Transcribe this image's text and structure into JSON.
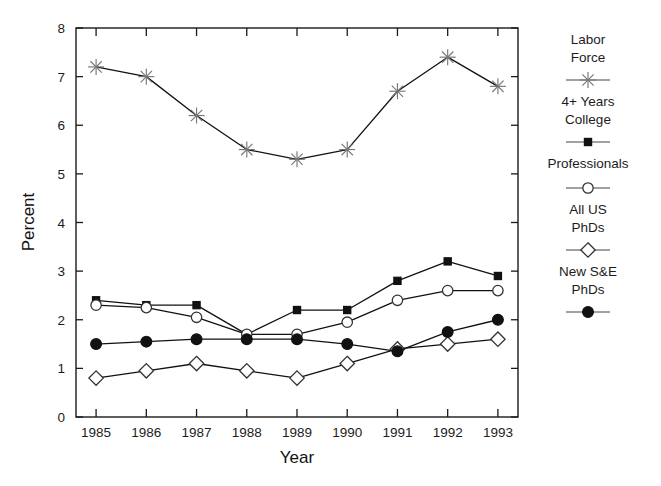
{
  "chart_data": {
    "type": "line",
    "title": "",
    "xlabel": "Year",
    "ylabel": "Percent",
    "categories": [
      "1985",
      "1986",
      "1987",
      "1988",
      "1989",
      "1990",
      "1991",
      "1992",
      "1993"
    ],
    "x": [
      1985,
      1986,
      1987,
      1988,
      1989,
      1990,
      1991,
      1992,
      1993
    ],
    "xlim": [
      1984.6,
      1993.4
    ],
    "ylim": [
      0,
      8
    ],
    "yticks": [
      0,
      1,
      2,
      3,
      4,
      5,
      6,
      7,
      8
    ],
    "xticks": [
      1985,
      1986,
      1987,
      1988,
      1989,
      1990,
      1991,
      1992,
      1993
    ],
    "grid": false,
    "legend_position": "right",
    "series": [
      {
        "name": "Labor Force",
        "marker": "asterisk",
        "values": [
          7.2,
          7.0,
          6.2,
          5.5,
          5.3,
          5.5,
          6.7,
          7.4,
          6.8
        ]
      },
      {
        "name": "4+ Years College",
        "marker": "filled-square",
        "values": [
          2.4,
          2.3,
          2.3,
          1.7,
          2.2,
          2.2,
          2.8,
          3.2,
          2.9
        ]
      },
      {
        "name": "Professionals",
        "marker": "open-circle",
        "values": [
          2.3,
          2.25,
          2.05,
          1.7,
          1.7,
          1.95,
          2.4,
          2.6,
          2.6
        ]
      },
      {
        "name": "All US PhDs",
        "marker": "open-diamond",
        "values": [
          0.8,
          0.95,
          1.1,
          0.95,
          0.8,
          1.1,
          1.4,
          1.5,
          1.6
        ]
      },
      {
        "name": "New S&E PhDs",
        "marker": "filled-circle",
        "values": [
          1.5,
          1.55,
          1.6,
          1.6,
          1.6,
          1.5,
          1.35,
          1.75,
          2.0
        ]
      }
    ]
  },
  "axes": {
    "y_title": "Percent",
    "x_title": "Year",
    "y_tick_labels": [
      "8",
      "7",
      "6",
      "5",
      "4",
      "3",
      "2",
      "1",
      "0"
    ],
    "x_tick_labels": [
      "1985",
      "1986",
      "1987",
      "1988",
      "1989",
      "1990",
      "1991",
      "1992",
      "1993"
    ]
  },
  "legend": {
    "entries": [
      {
        "line1": "Labor",
        "line2": "Force",
        "marker": "asterisk"
      },
      {
        "line1": "4+ Years",
        "line2": "College",
        "marker": "filled-square"
      },
      {
        "line1": "Professionals",
        "line2": "",
        "marker": "open-circle"
      },
      {
        "line1": "All US",
        "line2": "PhDs",
        "marker": "open-diamond"
      },
      {
        "line1": "New S&E",
        "line2": "PhDs",
        "marker": "filled-circle"
      }
    ]
  },
  "colors": {
    "line": "#111111",
    "star": "#777777",
    "text": "#1c1c1c",
    "background": "#ffffff"
  }
}
